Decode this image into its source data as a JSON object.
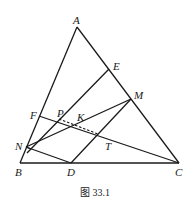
{
  "figure": {
    "caption": "图 33.1",
    "points": {
      "A": {
        "label": "A",
        "x": 77,
        "y": 27
      },
      "B": {
        "label": "B",
        "x": 20,
        "y": 163
      },
      "C": {
        "label": "C",
        "x": 179,
        "y": 163
      },
      "D": {
        "label": "D",
        "x": 71,
        "y": 163
      },
      "E": {
        "label": "E",
        "x": 109,
        "y": 69
      },
      "F": {
        "label": "F",
        "x": 39,
        "y": 116
      },
      "M": {
        "label": "M",
        "x": 131,
        "y": 99
      },
      "N": {
        "label": "N",
        "x": 26,
        "y": 147
      },
      "P": {
        "label": "P",
        "x": 59,
        "y": 119
      },
      "K": {
        "label": "K",
        "x": 73,
        "y": 124
      },
      "T": {
        "label": "T",
        "x": 98,
        "y": 134
      }
    },
    "segments": [
      [
        "A",
        "B"
      ],
      [
        "A",
        "C"
      ],
      [
        "B",
        "C"
      ],
      [
        "F",
        "C"
      ],
      [
        "B",
        "E"
      ],
      [
        "N",
        "M"
      ],
      [
        "M",
        "D"
      ],
      [
        "N",
        "D"
      ]
    ],
    "dashed_segments": [
      [
        "P",
        "T"
      ]
    ]
  }
}
